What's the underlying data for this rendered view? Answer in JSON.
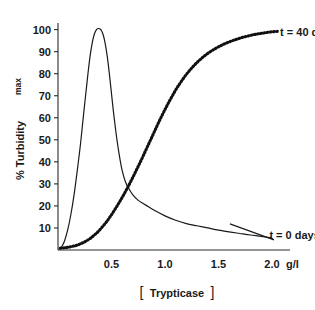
{
  "chart_data": {
    "type": "line",
    "title": "",
    "xlabel": "[Trypticase]",
    "xunit": "g/l",
    "ylabel": "% Turbidity",
    "ylabel_sub": "max",
    "xlim": [
      0,
      2.15
    ],
    "ylim": [
      0,
      103
    ],
    "grid": false,
    "legend_position": "inline-right",
    "xticks": [
      0.5,
      1.0,
      1.5,
      2.0
    ],
    "xtick_labels": [
      "0.5",
      "1.0",
      "1.5",
      "2.0"
    ],
    "yticks": [
      10,
      20,
      30,
      40,
      50,
      60,
      70,
      80,
      90,
      100
    ],
    "ytick_labels": [
      "10",
      "20",
      "30",
      "40",
      "50",
      "60",
      "70",
      "80",
      "90",
      "100"
    ],
    "series": [
      {
        "name": "t = 0 days",
        "style": "solid",
        "label_x": 1.92,
        "label_y": 7,
        "x": [
          0.03,
          0.06,
          0.09,
          0.12,
          0.15,
          0.18,
          0.21,
          0.24,
          0.26,
          0.28,
          0.3,
          0.32,
          0.34,
          0.36,
          0.38,
          0.4,
          0.42,
          0.44,
          0.46,
          0.48,
          0.5,
          0.52,
          0.54,
          0.56,
          0.58,
          0.6,
          0.63,
          0.66,
          0.7,
          0.75,
          0.8,
          0.85,
          0.9,
          1.0,
          1.1,
          1.2,
          1.3,
          1.4,
          1.5,
          1.6,
          1.7,
          1.8,
          1.9,
          2.0
        ],
        "y": [
          1,
          4,
          9,
          16,
          25,
          36,
          48,
          62,
          71,
          80,
          88,
          94,
          98,
          100,
          100.5,
          100,
          98,
          94,
          88,
          80,
          71,
          62,
          54,
          47,
          41,
          36,
          31,
          28,
          25,
          22.5,
          21,
          19.5,
          18,
          15.5,
          13.5,
          12,
          11,
          10,
          9,
          8.2,
          7.5,
          6.8,
          6.2,
          5.5
        ]
      },
      {
        "name": "t = 40 days",
        "style": "dotted",
        "label_x": 2.02,
        "label_y": 99,
        "x": [
          0.02,
          0.06,
          0.1,
          0.14,
          0.18,
          0.22,
          0.26,
          0.3,
          0.34,
          0.38,
          0.42,
          0.46,
          0.5,
          0.54,
          0.58,
          0.62,
          0.66,
          0.7,
          0.74,
          0.78,
          0.82,
          0.86,
          0.9,
          0.94,
          0.98,
          1.02,
          1.06,
          1.1,
          1.14,
          1.18,
          1.22,
          1.26,
          1.3,
          1.35,
          1.4,
          1.45,
          1.5,
          1.55,
          1.6,
          1.65,
          1.7,
          1.75,
          1.8,
          1.85,
          1.9,
          1.95,
          2.0,
          2.05
        ],
        "y": [
          0.8,
          1.0,
          1.3,
          1.7,
          2.2,
          3.0,
          4.0,
          5.2,
          6.8,
          8.6,
          10.8,
          13.2,
          16.0,
          19.0,
          22.2,
          25.6,
          29.2,
          33.0,
          37.0,
          41.0,
          45.2,
          49.4,
          53.6,
          57.8,
          61.8,
          65.6,
          69.2,
          72.6,
          75.6,
          78.4,
          80.9,
          83.1,
          85.1,
          87.3,
          89.2,
          90.8,
          92.2,
          93.4,
          94.4,
          95.3,
          96.1,
          96.8,
          97.4,
          97.9,
          98.3,
          98.7,
          99.0,
          99.2
        ]
      }
    ]
  },
  "accent_color": "#1a1a1a",
  "background_color": "#ffffff"
}
